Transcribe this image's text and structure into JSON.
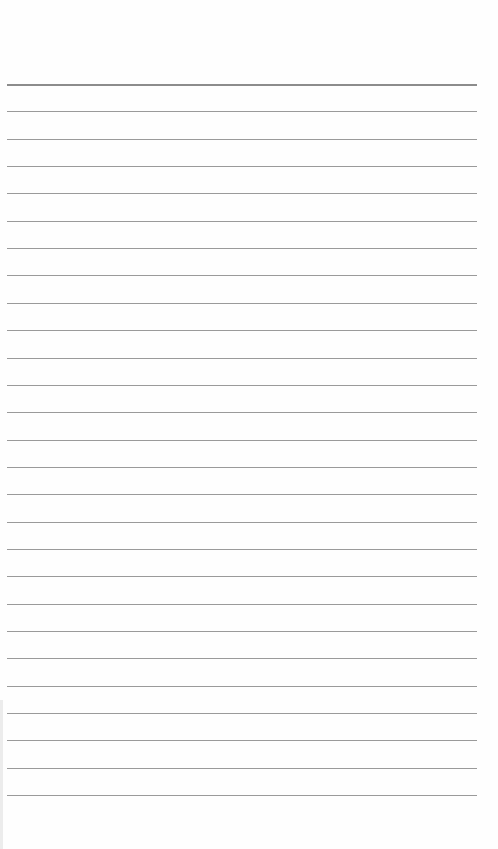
{
  "page": {
    "type": "lined-paper",
    "background": "#fefefe",
    "rule_color": "#9a9a9a",
    "header_rule_color": "#8c8c8c",
    "first_rule_y": 84,
    "rule_spacing": 27.35,
    "rule_count": 27,
    "rule_left": 7,
    "rule_width": 470
  }
}
